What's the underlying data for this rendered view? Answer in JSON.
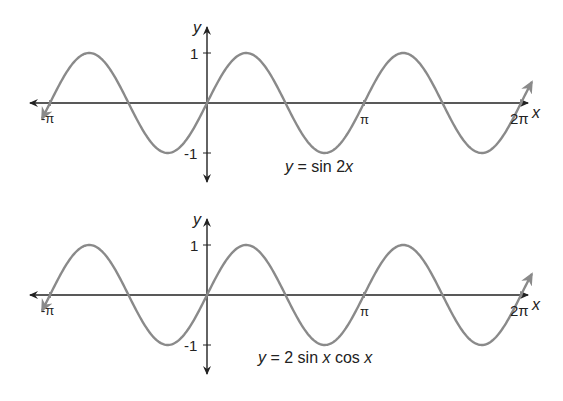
{
  "chart_data": [
    {
      "type": "line",
      "title": "y = sin 2x",
      "title_parts": {
        "lhs": "y",
        "eq": " = ",
        "fn": "sin 2",
        "var": "x"
      },
      "xlabel": "x",
      "ylabel": "y",
      "x_ticks": [
        {
          "value": -3.14159,
          "label": "-π"
        },
        {
          "value": 3.14159,
          "label": "π"
        },
        {
          "value": 6.28319,
          "label": "2π"
        }
      ],
      "y_ticks": [
        {
          "value": 1,
          "label": "1"
        },
        {
          "value": -1,
          "label": "-1"
        }
      ],
      "xlim": [
        -3.3,
        6.5
      ],
      "ylim": [
        -1.3,
        1.3
      ],
      "grid": false,
      "series": [
        {
          "name": "sin 2x",
          "function": "sin(2x)",
          "x_range": [
            -3.3,
            6.5
          ],
          "color": "#8a8a8a"
        }
      ]
    },
    {
      "type": "line",
      "title": "y = 2 sin x cos x",
      "title_parts": {
        "lhs": "y",
        "eq": " = 2 sin ",
        "v1": "x",
        "mid": " cos ",
        "v2": "x"
      },
      "xlabel": "x",
      "ylabel": "y",
      "x_ticks": [
        {
          "value": -3.14159,
          "label": "-π"
        },
        {
          "value": 3.14159,
          "label": "π"
        },
        {
          "value": 6.28319,
          "label": "2π"
        }
      ],
      "y_ticks": [
        {
          "value": 1,
          "label": "1"
        },
        {
          "value": -1,
          "label": "-1"
        }
      ],
      "xlim": [
        -3.3,
        6.5
      ],
      "ylim": [
        -1.3,
        1.3
      ],
      "grid": false,
      "series": [
        {
          "name": "2 sin x cos x",
          "function": "2*sin(x)*cos(x)",
          "x_range": [
            -3.3,
            6.5
          ],
          "color": "#8a8a8a"
        }
      ]
    }
  ],
  "colors": {
    "curve": "#8a8a8a",
    "axis": "#222222"
  }
}
